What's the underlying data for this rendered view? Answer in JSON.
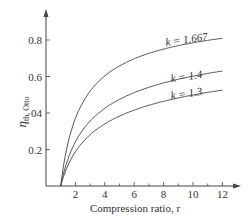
{
  "chart_data": {
    "type": "line",
    "title": "",
    "xlabel": "Compression ratio, r",
    "ylabel": "η_th, Otto",
    "ylabel_main": "η",
    "ylabel_sub": "th, Otto",
    "xlim": [
      0,
      13
    ],
    "ylim": [
      0,
      0.95
    ],
    "xticks": [
      2,
      4,
      6,
      8,
      10,
      12
    ],
    "yticks": [
      0.2,
      0.4,
      0.6,
      0.8
    ],
    "ytick_labels": [
      "0.2",
      "04",
      "0.6",
      "0.8"
    ],
    "grid": false,
    "legend": "inline labels",
    "x": [
      1,
      2,
      3,
      4,
      5,
      6,
      7,
      8,
      9,
      10,
      11,
      12
    ],
    "series": [
      {
        "name": "k = 1.667",
        "label": "k = 1.667",
        "values": [
          0,
          0.37,
          0.52,
          0.6,
          0.66,
          0.7,
          0.73,
          0.75,
          0.77,
          0.78,
          0.8,
          0.81
        ]
      },
      {
        "name": "k = 1.4",
        "label": "k = 1.4",
        "values": [
          0,
          0.24,
          0.36,
          0.43,
          0.47,
          0.51,
          0.54,
          0.56,
          0.58,
          0.6,
          0.62,
          0.63
        ]
      },
      {
        "name": "k = 1.3",
        "label": "k = 1.3",
        "values": [
          0,
          0.19,
          0.28,
          0.34,
          0.38,
          0.42,
          0.44,
          0.46,
          0.48,
          0.5,
          0.51,
          0.53
        ]
      }
    ]
  }
}
